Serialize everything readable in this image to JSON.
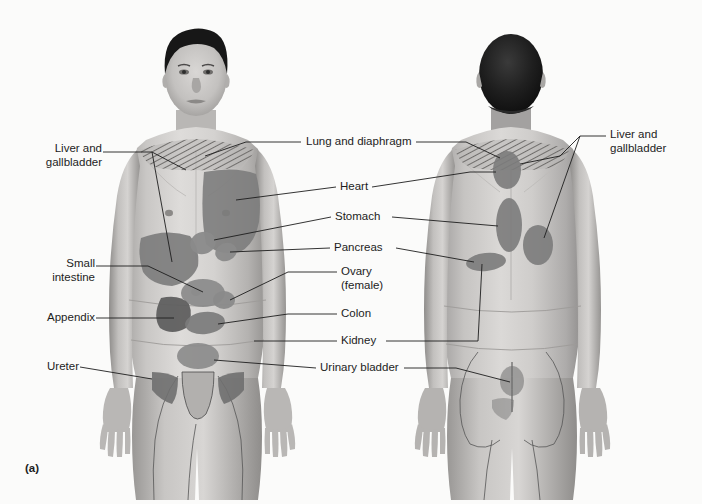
{
  "figure": {
    "caption": "(a)",
    "view_left": "anterior",
    "view_right": "posterior",
    "background_color": "#fbfbfa",
    "line_color": "#1d1d1d",
    "skin_light": "#d6d4d2",
    "skin_mid": "#b3b1af",
    "skin_dark": "#8e8c8a",
    "hair_color": "#171717",
    "organ_region_color": "#7b7b7b",
    "organ_region_color_dark": "#666666",
    "hatch_color": "#8a8886"
  },
  "labels": {
    "left": [
      {
        "id": "liver-gallbladder-left",
        "text": "Liver and\ngallbladder",
        "x": 27,
        "y": 146
      },
      {
        "id": "small-intestine",
        "text": "Small\nintestine",
        "x": 35,
        "y": 261
      },
      {
        "id": "appendix",
        "text": "Appendix",
        "x": 35,
        "y": 314
      },
      {
        "id": "ureter",
        "text": "Ureter",
        "x": 35,
        "y": 363
      }
    ],
    "center": [
      {
        "id": "lung-diaphragm",
        "text": "Lung and diaphragm",
        "x": 305,
        "y": 138
      },
      {
        "id": "heart",
        "text": "Heart",
        "x": 340,
        "y": 183
      },
      {
        "id": "stomach",
        "text": "Stomach",
        "x": 335,
        "y": 213
      },
      {
        "id": "pancreas",
        "text": "Pancreas",
        "x": 334,
        "y": 244
      },
      {
        "id": "ovary-female",
        "text": "Ovary\n(female)",
        "x": 341,
        "y": 268
      },
      {
        "id": "colon",
        "text": "Colon",
        "x": 341,
        "y": 310
      },
      {
        "id": "kidney",
        "text": "Kidney",
        "x": 341,
        "y": 337
      },
      {
        "id": "urinary-bladder",
        "text": "Urinary bladder",
        "x": 320,
        "y": 364
      }
    ],
    "right": [
      {
        "id": "liver-gallbladder-right",
        "text": "Liver and\ngallbladder",
        "x": 610,
        "y": 131
      }
    ]
  },
  "organ_regions": {
    "anterior": [
      "lung-diaphragm-shoulders",
      "heart-chest-left",
      "liver-gallbladder-right-upper",
      "stomach-epigastric",
      "pancreas-epigastric",
      "small-intestine-periumbilical",
      "appendix-right-lower",
      "colon-lower-abdomen",
      "ovary-pelvic",
      "urinary-bladder-suprapubic",
      "ureter-groin"
    ],
    "posterior": [
      "lung-diaphragm-shoulders",
      "liver-gallbladder-scapular",
      "heart-upper-back",
      "stomach-mid-back",
      "kidney-flank",
      "liver-gallbladder-right-flank",
      "urinary-bladder-sacral",
      "ureter-buttock"
    ]
  },
  "bleed_text": {
    "line1": " ",
    "line2": " "
  }
}
